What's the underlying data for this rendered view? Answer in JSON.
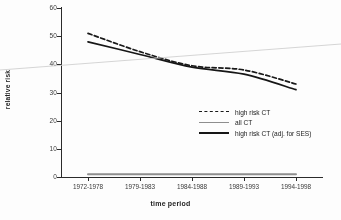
{
  "chart_data": {
    "type": "line",
    "title": "",
    "subtitle": "",
    "xlabel": "time period",
    "ylabel": "relative risk",
    "categories": [
      "1972-1978",
      "1979-1983",
      "1984-1988",
      "1989-1993",
      "1994-1998"
    ],
    "ylim": [
      0,
      60
    ],
    "yticks": [
      0,
      10,
      20,
      30,
      40,
      50,
      60
    ],
    "ytick_labels": [
      "0",
      "10",
      "20",
      "30",
      "40",
      "50",
      "60"
    ],
    "grid": false,
    "legend_position": "center-right",
    "series": [
      {
        "name": "high risk CT",
        "style": "dashed",
        "color": "#191919",
        "values": [
          51,
          44.5,
          39.5,
          38,
          33
        ]
      },
      {
        "name": "all CT",
        "style": "solid",
        "color": "#8f8f8f",
        "values": [
          1,
          1,
          1,
          1,
          1
        ]
      },
      {
        "name": "high risk CT (adj. for SES)",
        "style": "solid",
        "color": "#161616",
        "values": [
          48,
          43.5,
          39,
          36.5,
          31
        ]
      }
    ],
    "annotations": [
      {
        "name": "scan-artifact-line",
        "description": "faint gray diagonal scanning streak across figure",
        "color": "#cfcfcf"
      }
    ]
  },
  "axes": {
    "y_title": "relative risk",
    "x_title": "time period"
  },
  "legend": {
    "items": [
      {
        "label": "high risk CT",
        "swatch": "dashed-line-swatch"
      },
      {
        "label": "all CT",
        "swatch": "gray-line-swatch"
      },
      {
        "label": "high risk CT (adj. for SES)",
        "swatch": "solid-line-swatch"
      }
    ]
  }
}
